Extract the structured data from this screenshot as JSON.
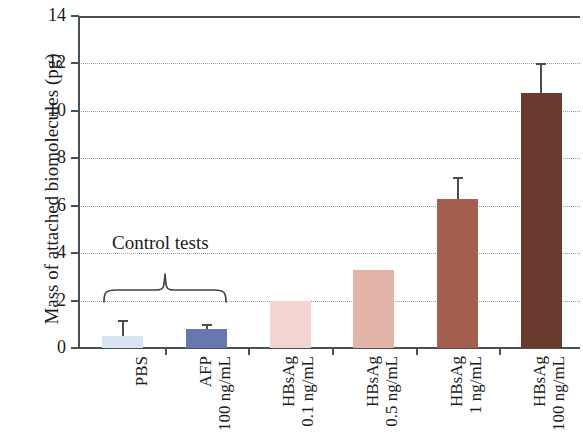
{
  "chart_data": {
    "type": "bar",
    "title": "",
    "xlabel": "",
    "ylabel": "Mass of attached biomolecules (pg)",
    "ylim": [
      0,
      14
    ],
    "ytick_values": [
      0,
      2,
      4,
      6,
      8,
      10,
      12,
      14
    ],
    "ytick_labels": [
      "0",
      "2",
      "4",
      "6",
      "8",
      "10",
      "12",
      "14"
    ],
    "grid": "horizontal-dotted",
    "legend": "none",
    "categories": [
      "PBS",
      "AFP 100 ng/mL",
      "HBsAg 0.1 ng/mL",
      "HBsAg 0.5 ng/mL",
      "HBsAg 1 ng/mL",
      "HBsAg 100 ng/mL"
    ],
    "category_lines": [
      {
        "line1": "PBS",
        "line2": ""
      },
      {
        "line1": "AFP",
        "line2": "100 ng/mL"
      },
      {
        "line1": "HBsAg",
        "line2": "0.1 ng/mL"
      },
      {
        "line1": "HBsAg",
        "line2": "0.5 ng/mL"
      },
      {
        "line1": "HBsAg",
        "line2": "1 ng/mL"
      },
      {
        "line1": "HBsAg",
        "line2": "100 ng/mL"
      }
    ],
    "values": [
      0.5,
      0.8,
      2.0,
      3.3,
      6.3,
      10.75
    ],
    "errors_upper": [
      1.2,
      1.0,
      null,
      null,
      7.2,
      12.0
    ],
    "bar_colors": [
      "#d9e4f2",
      "#6878ae",
      "#f2d5d0",
      "#e2b3a7",
      "#a4604f",
      "#6b3a2e"
    ],
    "annotations": [
      {
        "text": "Control tests",
        "spans_categories": [
          "PBS",
          "AFP 100 ng/mL"
        ]
      }
    ]
  },
  "axis": {
    "label_color": "#1b1b1b",
    "line_color": "#4a4f55",
    "grid_color": "#9a9a9a"
  }
}
